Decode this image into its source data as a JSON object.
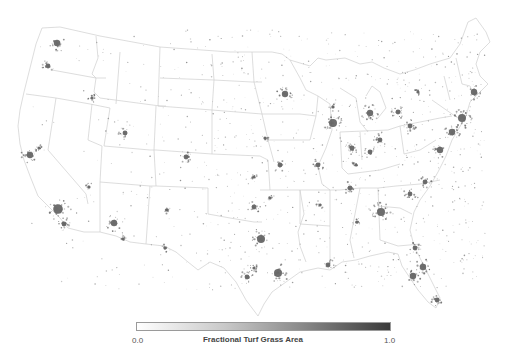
{
  "figure": {
    "type": "choropleth-dot-map",
    "region": "Conterminous United States",
    "background_color": "#ffffff",
    "state_border_color": "#c8c8c8",
    "data_color": "#5a5a5a"
  },
  "legend": {
    "title": "Fractional Turf Grass Area",
    "min_label": "0.0",
    "max_label": "1.0",
    "gradient_start": "#ffffff",
    "gradient_end": "#3a3a3a"
  },
  "hotspots": [
    {
      "name": "Seattle",
      "x": 57,
      "y": 43,
      "r": 4
    },
    {
      "name": "Portland",
      "x": 48,
      "y": 66,
      "r": 3
    },
    {
      "name": "San Francisco Bay",
      "x": 30,
      "y": 155,
      "r": 4
    },
    {
      "name": "Sacramento",
      "x": 39,
      "y": 148,
      "r": 2
    },
    {
      "name": "Los Angeles",
      "x": 58,
      "y": 209,
      "r": 6
    },
    {
      "name": "San Diego",
      "x": 64,
      "y": 224,
      "r": 3
    },
    {
      "name": "Las Vegas",
      "x": 89,
      "y": 187,
      "r": 2
    },
    {
      "name": "Phoenix",
      "x": 114,
      "y": 223,
      "r": 4
    },
    {
      "name": "Tucson",
      "x": 123,
      "y": 239,
      "r": 2
    },
    {
      "name": "Salt Lake City",
      "x": 125,
      "y": 133,
      "r": 3
    },
    {
      "name": "Boise",
      "x": 92,
      "y": 98,
      "r": 2
    },
    {
      "name": "Denver",
      "x": 186,
      "y": 157,
      "r": 3
    },
    {
      "name": "Albuquerque",
      "x": 167,
      "y": 210,
      "r": 2
    },
    {
      "name": "El Paso",
      "x": 165,
      "y": 248,
      "r": 2
    },
    {
      "name": "Minneapolis",
      "x": 285,
      "y": 94,
      "r": 4
    },
    {
      "name": "Omaha",
      "x": 265,
      "y": 138,
      "r": 2
    },
    {
      "name": "Kansas City",
      "x": 280,
      "y": 165,
      "r": 3
    },
    {
      "name": "Wichita",
      "x": 254,
      "y": 177,
      "r": 2
    },
    {
      "name": "Oklahoma City",
      "x": 254,
      "y": 207,
      "r": 3
    },
    {
      "name": "Tulsa",
      "x": 270,
      "y": 198,
      "r": 2
    },
    {
      "name": "Dallas-Fort Worth",
      "x": 261,
      "y": 239,
      "r": 5
    },
    {
      "name": "Austin",
      "x": 254,
      "y": 268,
      "r": 2
    },
    {
      "name": "San Antonio",
      "x": 247,
      "y": 277,
      "r": 3
    },
    {
      "name": "Houston",
      "x": 278,
      "y": 273,
      "r": 5
    },
    {
      "name": "Chicago",
      "x": 333,
      "y": 123,
      "r": 5
    },
    {
      "name": "Milwaukee",
      "x": 333,
      "y": 107,
      "r": 2
    },
    {
      "name": "Detroit",
      "x": 370,
      "y": 113,
      "r": 4
    },
    {
      "name": "Indianapolis",
      "x": 352,
      "y": 148,
      "r": 3
    },
    {
      "name": "Columbus",
      "x": 380,
      "y": 140,
      "r": 3
    },
    {
      "name": "Cincinnati",
      "x": 370,
      "y": 152,
      "r": 3
    },
    {
      "name": "St. Louis",
      "x": 318,
      "y": 165,
      "r": 3
    },
    {
      "name": "Memphis",
      "x": 320,
      "y": 205,
      "r": 2
    },
    {
      "name": "Nashville",
      "x": 350,
      "y": 188,
      "r": 3
    },
    {
      "name": "Atlanta",
      "x": 381,
      "y": 212,
      "r": 5
    },
    {
      "name": "Charlotte",
      "x": 410,
      "y": 194,
      "r": 3
    },
    {
      "name": "Raleigh",
      "x": 425,
      "y": 182,
      "r": 3
    },
    {
      "name": "Washington DC",
      "x": 440,
      "y": 150,
      "r": 4
    },
    {
      "name": "Philadelphia",
      "x": 452,
      "y": 132,
      "r": 4
    },
    {
      "name": "New York",
      "x": 462,
      "y": 118,
      "r": 5
    },
    {
      "name": "Boston",
      "x": 474,
      "y": 92,
      "r": 4
    },
    {
      "name": "Pittsburgh",
      "x": 410,
      "y": 126,
      "r": 3
    },
    {
      "name": "Cleveland",
      "x": 398,
      "y": 112,
      "r": 3
    },
    {
      "name": "Buffalo",
      "x": 418,
      "y": 92,
      "r": 2
    },
    {
      "name": "Jacksonville",
      "x": 415,
      "y": 248,
      "r": 3
    },
    {
      "name": "Orlando",
      "x": 423,
      "y": 267,
      "r": 4
    },
    {
      "name": "Tampa",
      "x": 413,
      "y": 276,
      "r": 4
    },
    {
      "name": "Miami",
      "x": 437,
      "y": 300,
      "r": 3
    },
    {
      "name": "New Orleans",
      "x": 328,
      "y": 265,
      "r": 3
    },
    {
      "name": "Birmingham",
      "x": 357,
      "y": 222,
      "r": 2
    },
    {
      "name": "Louisville",
      "x": 356,
      "y": 165,
      "r": 2
    }
  ]
}
